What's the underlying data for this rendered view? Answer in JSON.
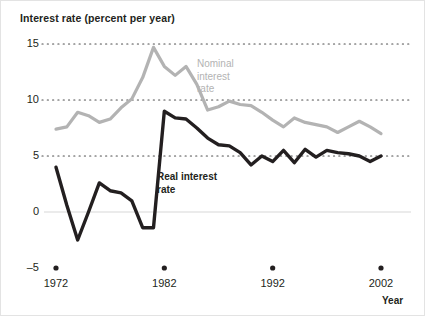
{
  "chart_data": {
    "type": "line",
    "title": "Interest rate (percent per year)",
    "xlabel": "Year",
    "ylabel": "Interest rate (percent per year)",
    "xlim": [
      1972,
      2002
    ],
    "ylim": [
      -5,
      15
    ],
    "yticks": [
      15,
      10,
      5,
      0,
      -5
    ],
    "ytick_labels": [
      "15",
      "10",
      "5",
      "0",
      "–5"
    ],
    "xticks": [
      1972,
      1982,
      1992,
      2002
    ],
    "xtick_labels": [
      "1972",
      "1982",
      "1992",
      "2002"
    ],
    "grid": "horizontal dotted gridlines at 15, 10 and 5; solid light line at 0",
    "legend_position": "inline annotations on plot",
    "x": [
      1972,
      1973,
      1974,
      1975,
      1976,
      1977,
      1978,
      1979,
      1980,
      1981,
      1982,
      1983,
      1984,
      1985,
      1986,
      1987,
      1988,
      1989,
      1990,
      1991,
      1992,
      1993,
      1994,
      1995,
      1996,
      1997,
      1998,
      1999,
      2000,
      2001,
      2002
    ],
    "series": [
      {
        "name": "Nominal interest rate",
        "color": "#b3b3b3",
        "label_text": "Nominal\ninterest\nrate",
        "values": [
          7.4,
          7.6,
          8.9,
          8.6,
          8.0,
          8.3,
          9.3,
          10.1,
          12.0,
          14.7,
          13.0,
          12.2,
          13.0,
          11.4,
          9.1,
          9.4,
          9.9,
          9.6,
          9.5,
          8.9,
          8.2,
          7.6,
          8.4,
          8.0,
          7.8,
          7.6,
          7.1,
          7.6,
          8.1,
          7.6,
          7.0
        ]
      },
      {
        "name": "Real interest rate",
        "color": "#231f20",
        "label_text": "Real interest\nrate",
        "values": [
          4.0,
          0.6,
          -2.5,
          0.0,
          2.6,
          1.9,
          1.7,
          1.0,
          -1.4,
          -1.4,
          9.0,
          8.4,
          8.3,
          7.5,
          6.6,
          6.0,
          5.9,
          5.3,
          4.2,
          5.0,
          4.5,
          5.5,
          4.4,
          5.6,
          4.9,
          5.5,
          5.3,
          5.2,
          5.0,
          4.5,
          5.0
        ]
      }
    ]
  },
  "annotations": {
    "nominal_label": "Nominal\ninterest\nrate",
    "real_label": "Real interest\nrate"
  },
  "axis": {
    "y_labels": [
      "15",
      "10",
      "5",
      "0",
      "–5"
    ],
    "x_labels": [
      "1972",
      "1982",
      "1992",
      "2002"
    ],
    "x_title": "Year"
  }
}
